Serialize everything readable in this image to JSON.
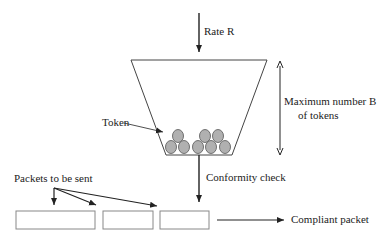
{
  "diagram": {
    "labels": {
      "rate": "Rate R",
      "max_line1": "Maximum number B",
      "max_line2": "of tokens",
      "token": "Token",
      "conformity": "Conformity check",
      "packets": "Packets to be sent",
      "compliant": "Compliant packet"
    },
    "colors": {
      "line": "#222222",
      "token_fill": "#b0b0b0",
      "box_stroke": "#888888"
    },
    "tokens": {
      "bottom_row": 5,
      "top_row": 3,
      "total": 8
    },
    "packets": {
      "count": 3
    }
  }
}
